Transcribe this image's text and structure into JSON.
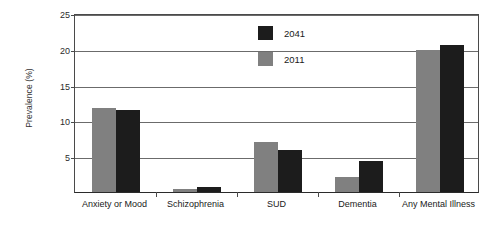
{
  "chart_data": {
    "type": "bar",
    "title": "",
    "xlabel": "",
    "ylabel": "Prevalence (%)",
    "ylim": [
      0,
      25
    ],
    "yticks": [
      0,
      5,
      10,
      15,
      20,
      25
    ],
    "ytick_labels": [
      "",
      "5",
      "10",
      "15",
      "20",
      "25"
    ],
    "grid": "horizontal",
    "legend_position": "top-center",
    "categories": [
      "Anxiety or Mood",
      "Schizophrenia",
      "SUD",
      "Dementia",
      "Any Mental Illness"
    ],
    "series": [
      {
        "name": "2011",
        "color": "#808080",
        "values": [
          11.7,
          0.4,
          7.0,
          2.1,
          19.8
        ]
      },
      {
        "name": "2041",
        "color": "#1c1c1c",
        "values": [
          11.4,
          0.7,
          5.8,
          4.3,
          20.6
        ]
      }
    ]
  },
  "legend": {
    "entries": [
      {
        "label": "2041",
        "swatch": "black-square"
      },
      {
        "label": "2011",
        "swatch": "gray-square"
      }
    ]
  },
  "colors": {
    "series_2011": "#808080",
    "series_2041": "#1c1c1c",
    "axis": "#2b2b2b",
    "grid": "#6b6b6b",
    "background": "#ffffff"
  }
}
